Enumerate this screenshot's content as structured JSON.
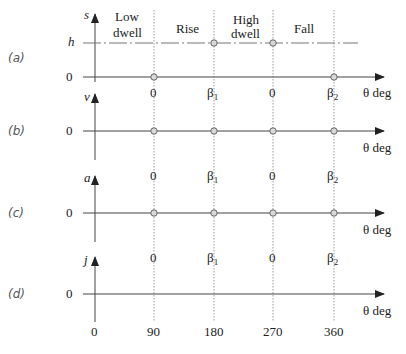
{
  "diagram": {
    "regions": [
      "Low dwell",
      "Rise",
      "High dwell",
      "Fall"
    ],
    "region_labels": {
      "low_dwell_line1": "Low",
      "low_dwell_line2": "dwell",
      "rise": "Rise",
      "high_dwell_line1": "High",
      "high_dwell_line2": "dwell",
      "fall": "Fall"
    },
    "axis_label_x": "θ deg",
    "panels": [
      {
        "id": "a",
        "tag": "(a)",
        "y_label": "s",
        "zero_label": "0",
        "level_label": "h",
        "ticks": [
          "0",
          "β1",
          "0",
          "β2"
        ]
      },
      {
        "id": "b",
        "tag": "(b)",
        "y_label": "v",
        "zero_label": "0",
        "ticks": [
          "0",
          "β1",
          "0",
          "β2"
        ]
      },
      {
        "id": "c",
        "tag": "(c)",
        "y_label": "a",
        "zero_label": "0",
        "ticks": [
          "0",
          "β1",
          "0",
          "β2"
        ]
      },
      {
        "id": "d",
        "tag": "(d)",
        "y_label": "j",
        "zero_label": "0",
        "ticks": [
          "0",
          "β1",
          "0",
          "β2"
        ]
      }
    ],
    "degree_ticks": [
      "0",
      "90",
      "180",
      "270",
      "360"
    ],
    "beta1_base": "β",
    "beta1_sub": "1",
    "beta2_base": "β",
    "beta2_sub": "2",
    "colors": {
      "axis": "#444444",
      "dotted": "#9a9a9a",
      "marker_stroke": "#666666",
      "marker_fill": "#d8d8d8"
    }
  }
}
